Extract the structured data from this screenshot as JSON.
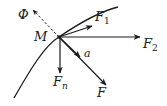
{
  "diagram": {
    "type": "force-diagram",
    "colors": {
      "stroke": "#1a1a1a",
      "background": "#ffffff"
    },
    "point": {
      "label": "M",
      "x": 59,
      "y": 37
    },
    "trajectory": {
      "shape": "curve",
      "from": [
        14,
        98
      ],
      "to": [
        118,
        7
      ]
    },
    "vectors": [
      {
        "id": "phi",
        "label": "Φ",
        "sub": "",
        "style": "dashed",
        "to": [
          33,
          10
        ],
        "label_pos": [
          18,
          19
        ]
      },
      {
        "id": "f1",
        "label": "F",
        "sub": "1",
        "style": "solid",
        "to": [
          92,
          26
        ],
        "label_pos": [
          95,
          21
        ]
      },
      {
        "id": "f2",
        "label": "F",
        "sub": "2",
        "style": "solid",
        "to": [
          140,
          37
        ],
        "label_pos": [
          143,
          48
        ]
      },
      {
        "id": "a",
        "label": "a",
        "sub": "",
        "style": "solid",
        "to": [
          80,
          57
        ],
        "label_pos": [
          84,
          57
        ]
      },
      {
        "id": "f",
        "label": "F",
        "sub": "",
        "style": "solid",
        "to": [
          106,
          85
        ],
        "label_pos": [
          97,
          97
        ]
      },
      {
        "id": "fn",
        "label": "F",
        "sub": "n",
        "style": "solid",
        "to": [
          60,
          73
        ],
        "label_pos": [
          53,
          86
        ]
      }
    ]
  }
}
